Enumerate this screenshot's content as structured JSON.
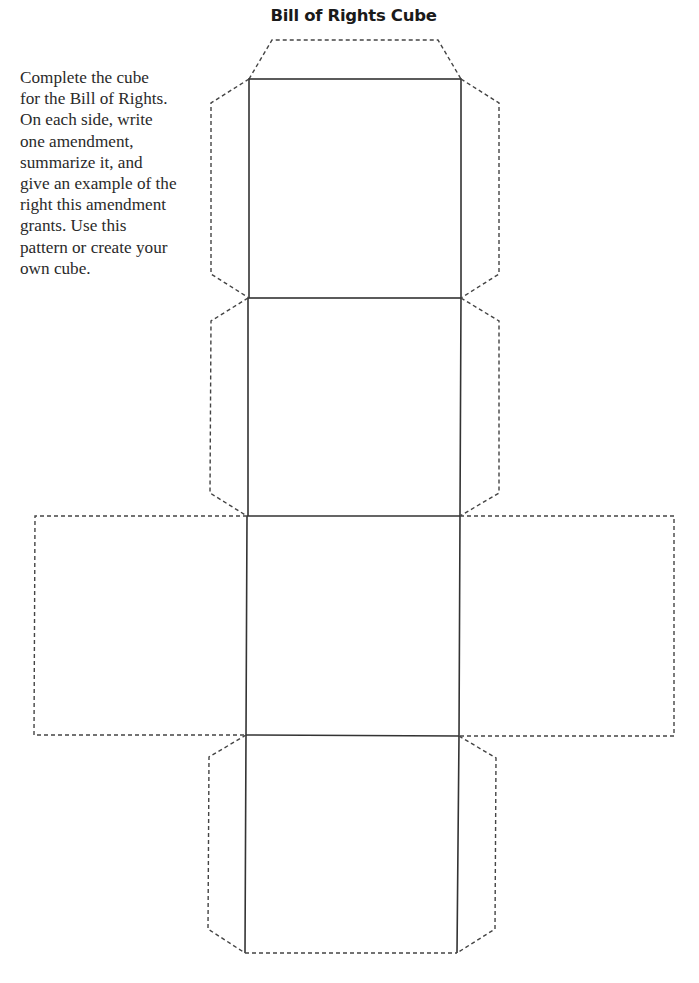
{
  "title": "Bill of Rights Cube",
  "instructions": {
    "lines": [
      "Complete the cube",
      "for the Bill of Rights.",
      "On each side, write",
      "one amendment,",
      "summarize it, and",
      "give an example of the",
      "right this amendment",
      "grants. Use this",
      "pattern or create your",
      "own cube."
    ]
  },
  "cube_net": {
    "faces": [
      "face-1",
      "face-2",
      "face-3",
      "face-4",
      "face-left",
      "face-right"
    ],
    "fold_lines": "solid",
    "cut_lines": "dashed"
  }
}
